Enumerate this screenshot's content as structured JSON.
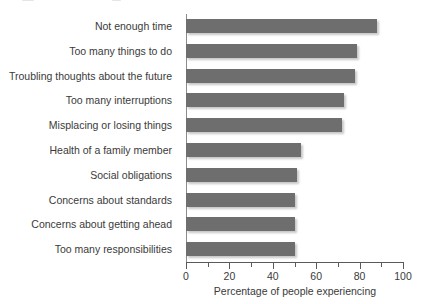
{
  "chart_data": {
    "type": "bar",
    "orientation": "horizontal",
    "title": "",
    "xlabel": "Percentage of people experiencing",
    "ylabel": "",
    "xlim": [
      0,
      100
    ],
    "xticks": [
      0,
      20,
      40,
      60,
      80,
      100
    ],
    "xtick_labels": [
      "0",
      "20",
      "40",
      "60",
      "80",
      "100"
    ],
    "minor_xticks": [
      10,
      30,
      50,
      70,
      90
    ],
    "grid": false,
    "legend": false,
    "bar_color": "#6e6e6e",
    "categories": [
      "Not enough time",
      "Too many things to do",
      "Troubling thoughts about the future",
      "Too many interruptions",
      "Misplacing or losing things",
      "Health of a family member",
      "Social obligations",
      "Concerns about standards",
      "Concerns about getting ahead",
      "Too many responsibilities"
    ],
    "values": [
      88,
      79,
      78,
      73,
      72,
      53,
      51,
      50,
      50,
      50
    ]
  },
  "axis": {
    "x_title": "Percentage of people experiencing"
  }
}
